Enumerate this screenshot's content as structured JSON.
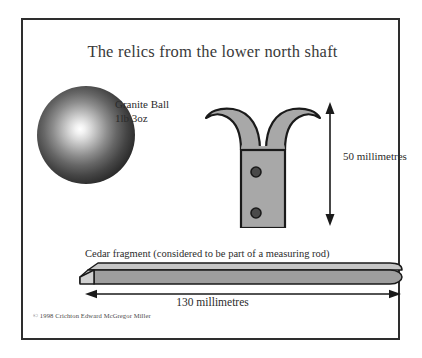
{
  "plate": {
    "title": "The relics from the lower north shaft",
    "copyright": "© 1998 Crichton Edward McGregor Miller",
    "border_color": "#2e2e2e",
    "background_color": "#ffffff"
  },
  "artifacts": {
    "granite_ball": {
      "label_line1": "Granite Ball",
      "label_line2": "1lb 3oz",
      "shading": "radial-gradient-sphere",
      "highlight_color": "#ffffff",
      "shadow_color": "#000000"
    },
    "hook_tool": {
      "name": "double-hook-iron-tool",
      "fill_color": "#a8a8a8",
      "outline_color": "#1a1a1a",
      "rivet_color": "#4a4a4a",
      "rivet_count": 2
    },
    "cedar_rod": {
      "caption": "Cedar fragment (considered to be part of a measuring rod)",
      "top_face_color": "#c0c0c0",
      "front_face_color": "#9a9a9a",
      "end_face_color": "#d4d4d4",
      "outline_color": "#1a1a1a"
    }
  },
  "dimensions": {
    "vertical": {
      "label": "50 millimetres",
      "value": 50,
      "unit": "millimetres",
      "orientation": "vertical",
      "arrow_color": "#1a1a1a"
    },
    "horizontal": {
      "label": "130 millimetres",
      "value": 130,
      "unit": "millimetres",
      "orientation": "horizontal",
      "arrow_color": "#1a1a1a"
    }
  }
}
